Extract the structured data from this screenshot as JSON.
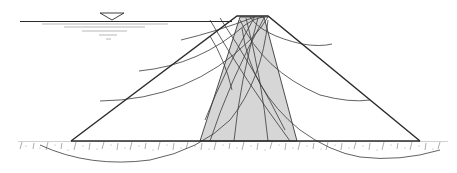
{
  "diagram": {
    "colors": {
      "line": "#2a2a2a",
      "core_fill": "#d6d6d6",
      "background": "#ffffff",
      "ground": "#8a8a8a"
    },
    "elements": {
      "water_level_symbol": "inverted-triangle",
      "water_surface_y": 21,
      "crest": {
        "x1": 237,
        "x2": 268,
        "y": 16
      },
      "base_y": 141,
      "upstream_toe_x": 71,
      "downstream_toe_x": 420,
      "core": {
        "top_left_x": 240,
        "top_right_x": 264,
        "bottom_left_x": 200,
        "bottom_right_x": 297
      }
    },
    "labels": []
  }
}
